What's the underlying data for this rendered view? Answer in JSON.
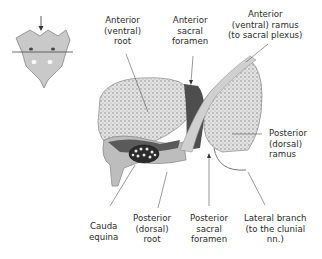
{
  "diagram": {
    "type": "anatomical-cross-section",
    "inset": {
      "description": "Posterior view of sacrum with arrow and horizontal section line"
    },
    "labels": {
      "anterior_root": [
        "Anterior",
        "(ventral)",
        "root"
      ],
      "anterior_sacral_foramen": [
        "Anterior",
        "sacral",
        "foramen"
      ],
      "anterior_ramus": [
        "Anterior",
        "(ventral) ramus",
        "(to sacral plexus)"
      ],
      "posterior_ramus": [
        "Posterior",
        "(dorsal)",
        "ramus"
      ],
      "cauda_equina": [
        "Cauda",
        "equina"
      ],
      "posterior_root": [
        "Posterior",
        "(dorsal)",
        "root"
      ],
      "posterior_sacral_foramen": [
        "Posterior",
        "sacral",
        "foramen"
      ],
      "lateral_branch": [
        "Lateral branch",
        "(to the clunial",
        "nn.)"
      ]
    },
    "colors": {
      "bone": "#d8d8d8",
      "bone_texture": "#8a8a8a",
      "dark_canal": "#4a4a4a",
      "nerve": "#c8c8c8",
      "leader_line": "#555555",
      "text": "#2a2a2a"
    }
  }
}
